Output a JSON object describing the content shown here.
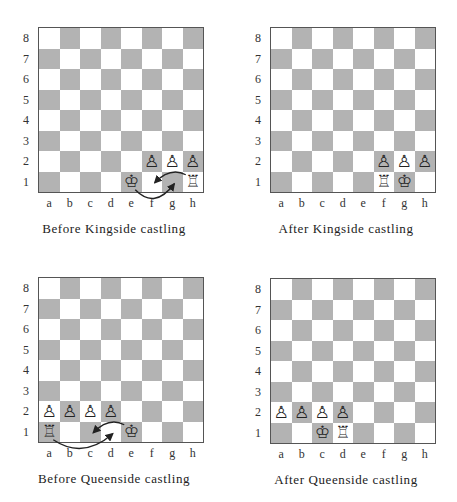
{
  "colors": {
    "light_square": "#ffffff",
    "dark_square": "#b3b3b3",
    "border": "#555555",
    "arrow": "#222222"
  },
  "files": [
    "a",
    "b",
    "c",
    "d",
    "e",
    "f",
    "g",
    "h"
  ],
  "ranks": [
    "8",
    "7",
    "6",
    "5",
    "4",
    "3",
    "2",
    "1"
  ],
  "piece_glyphs": {
    "K": "♔",
    "R": "♖",
    "P": "♙"
  },
  "diagrams": [
    {
      "caption": "Before Kingside castling",
      "pieces": {
        "f2": "P",
        "g2": "P",
        "h2": "P",
        "e1": "K",
        "h1": "R"
      },
      "arrows": [
        {
          "piece": "king",
          "from": "e1",
          "to": "g1",
          "route": "below-board"
        },
        {
          "piece": "rook",
          "from": "h1",
          "to": "f1",
          "route": "over-squares"
        }
      ]
    },
    {
      "caption": "After Kingside castling",
      "pieces": {
        "f2": "P",
        "g2": "P",
        "h2": "P",
        "f1": "R",
        "g1": "K"
      },
      "arrows": []
    },
    {
      "caption": "Before Queenside castling",
      "pieces": {
        "a2": "P",
        "b2": "P",
        "c2": "P",
        "d2": "P",
        "a1": "R",
        "e1": "K"
      },
      "arrows": [
        {
          "piece": "rook",
          "from": "a1",
          "to": "d1",
          "route": "below-board"
        },
        {
          "piece": "king",
          "from": "e1",
          "to": "c1",
          "route": "over-squares"
        }
      ]
    },
    {
      "caption": "After Queenside castling",
      "pieces": {
        "a2": "P",
        "b2": "P",
        "c2": "P",
        "d2": "P",
        "c1": "K",
        "d1": "R"
      },
      "arrows": []
    }
  ]
}
